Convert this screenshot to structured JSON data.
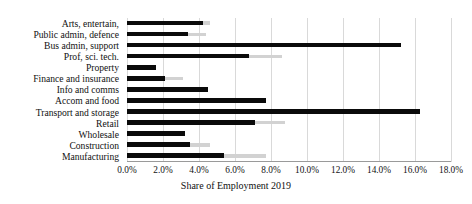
{
  "chart_data": {
    "type": "bar",
    "orientation": "horizontal",
    "title": "",
    "xlabel": "Share of Employment 2019",
    "ylabel": "",
    "xlim": [
      0,
      18
    ],
    "xtick_labels": [
      "0.0%",
      "2.0%",
      "4.0%",
      "6.0%",
      "8.0%",
      "10.0%",
      "12.0%",
      "14.0%",
      "16.0%",
      "18.0%"
    ],
    "xtick_values": [
      0,
      2,
      4,
      6,
      8,
      10,
      12,
      14,
      16,
      18
    ],
    "grid": true,
    "legend": "none",
    "categories": [
      "Arts, entertain,",
      "Public admin, defence",
      "Bus admin, support",
      "Prof, sci. tech.",
      "Property",
      "Finance and insurance",
      "Info and comms",
      "Accom and food",
      "Transport and storage",
      "Retail",
      "Wholesale",
      "Construction",
      "Manufacturing"
    ],
    "series": [
      {
        "name": "dark",
        "color": "#0a0a0a",
        "values": [
          4.2,
          3.4,
          15.2,
          6.8,
          1.6,
          2.1,
          4.5,
          7.7,
          16.3,
          7.1,
          3.2,
          3.5,
          5.4
        ]
      },
      {
        "name": "light",
        "color": "#d2d2d2",
        "values": [
          4.6,
          4.4,
          15.2,
          8.6,
          1.6,
          3.1,
          4.1,
          7.7,
          16.3,
          8.8,
          3.2,
          4.6,
          7.7
        ]
      }
    ]
  }
}
